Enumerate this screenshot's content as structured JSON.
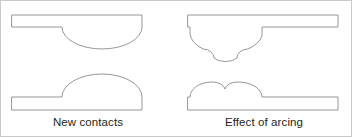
{
  "figure": {
    "width": 352,
    "height": 137,
    "background_color": "#ffffff",
    "frame_color": "#c9c9c9",
    "stroke_color": "#8a8a8a",
    "fill_color": "#ffffff",
    "text_color": "#231f20"
  },
  "panels": [
    {
      "id": "left",
      "caption": "New contacts",
      "parts": [
        {
          "name": "upper-contact-new",
          "description": "Horizontal bar with smooth semi-elliptical dome hanging below at its right end"
        },
        {
          "name": "lower-contact-new",
          "description": "Horizontal bar with smooth semi-elliptical dome rising above at its right end"
        }
      ]
    },
    {
      "id": "right",
      "caption": "Effect of arcing",
      "parts": [
        {
          "name": "upper-contact-arced",
          "description": "Horizontal bar with eroded dome below showing two concave notches and a central pip"
        },
        {
          "name": "lower-contact-arced",
          "description": "Horizontal bar with worn dome above showing two rounded bumps and a central valley"
        }
      ]
    }
  ],
  "captions": {
    "left": "New contacts",
    "right": "Effect of arcing"
  }
}
